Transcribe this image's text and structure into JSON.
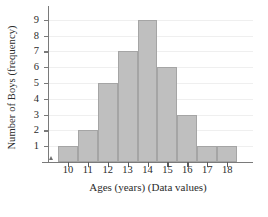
{
  "chart_data": {
    "type": "bar",
    "title": "",
    "subtitle": "",
    "xlabel": "Ages (years) (Data values)",
    "ylabel": "Number of Boys (frequency)",
    "categories": [
      "10",
      "11",
      "12",
      "13",
      "14",
      "15",
      "16",
      "17",
      "18"
    ],
    "values": [
      1,
      2,
      5,
      7,
      9,
      6,
      3,
      1,
      1
    ],
    "series": [
      {
        "name": "Number of Boys",
        "values": [
          1,
          2,
          5,
          7,
          9,
          6,
          3,
          1,
          1
        ]
      }
    ],
    "bin_edges": [
      9.5,
      10.5,
      11.5,
      12.5,
      13.5,
      14.5,
      15.5,
      16.5,
      17.5,
      18.5
    ],
    "xlim": [
      9.0,
      19.3
    ],
    "ylim": [
      0,
      9.5
    ],
    "ytick_labels": [
      "1",
      "2",
      "3",
      "4",
      "5",
      "6",
      "7",
      "8",
      "9"
    ],
    "ytick_values": [
      1,
      2,
      3,
      4,
      5,
      6,
      7,
      8,
      9
    ],
    "xtick_labels": [
      "10",
      "11",
      "12",
      "13",
      "14",
      "15",
      "16",
      "17",
      "18"
    ],
    "xtick_values": [
      10,
      11,
      12,
      13,
      14,
      15,
      16,
      17,
      18
    ],
    "grid": true,
    "grid_axis": "y",
    "legend": false,
    "legend_position": "none",
    "total_count": 35,
    "bar_fill_color": "#bfbfbf",
    "bar_edge_color": "#a5a5a5",
    "gridline_color": "#efefef",
    "axis_color": "#7a7a7a",
    "text_color": "#2b2b2b",
    "background_color": "#ffffff"
  }
}
